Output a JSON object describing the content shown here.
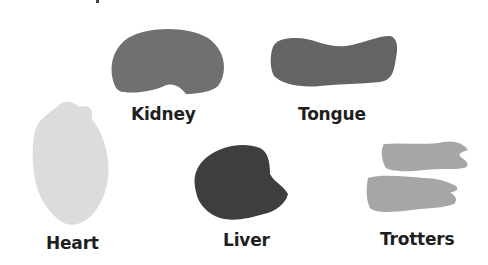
{
  "organs": [
    {
      "name": "kidney",
      "label": "Kidney",
      "color": "#707070"
    },
    {
      "name": "tongue",
      "label": "Tongue",
      "color": "#646464"
    },
    {
      "name": "heart",
      "label": "Heart",
      "color": "#dcdcdc"
    },
    {
      "name": "liver",
      "label": "Liver",
      "color": "#3e3e3e"
    },
    {
      "name": "trotters",
      "label": "Trotters",
      "color": "#a6a6a6"
    }
  ]
}
